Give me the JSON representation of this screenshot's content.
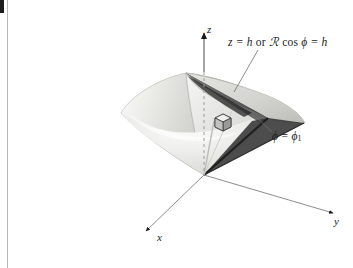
{
  "figure": {
    "kind": "3d-coordinate-diagram",
    "background_color": "#ffffff",
    "ink_color": "#1a1a1a"
  },
  "axes": {
    "z": {
      "label": "z",
      "style": "dashed-inside-solid-outside"
    },
    "x": {
      "label": "x",
      "style": "solid-arrow"
    },
    "y": {
      "label": "y",
      "style": "solid-arrow"
    }
  },
  "annotations": {
    "plane": {
      "full_text": "z = h or ℛ cos ϕ = h",
      "lhs": "z = h",
      "conjunction": "or",
      "script_r": "ℛ",
      "trig": "cos",
      "angle": "ϕ",
      "rhs": "= h"
    },
    "wedge": {
      "full_text": "ϕ = ϕ₁",
      "symbol": "ϕ",
      "equals": "=",
      "sub_symbol": "ϕ",
      "subscript": "1"
    }
  },
  "elements": {
    "volume_element": "differential-volume-cube",
    "cone_surface": "shaded-cone",
    "cut_wedge": "dark-wedge-sector",
    "cap_plane": "light-gray-cap"
  },
  "colors": {
    "cone_light": "#f0f0ee",
    "cone_mid": "#d6d6d2",
    "cone_dark": "#a8a8a4",
    "wedge_dark": "#4a4a4a",
    "wedge_darker": "#2e2e2e",
    "cap_gray": "#c9c9c6",
    "edge_rule": "#b9b9b9",
    "ink": "#1a1a1a"
  }
}
